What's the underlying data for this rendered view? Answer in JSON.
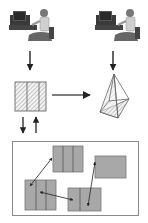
{
  "diagram": {
    "colors": {
      "background": "#ffffff",
      "stroke": "#555555",
      "arrow": "#222222",
      "block_fill": "#a8a8a8",
      "hatch": "#9a9a9a",
      "frame": "#8a8a8a"
    },
    "nodes": [
      {
        "id": "user-left",
        "type": "person-at-computer",
        "x": 10,
        "y": 5
      },
      {
        "id": "user-right",
        "type": "person-at-computer",
        "x": 96,
        "y": 5
      },
      {
        "id": "plan-view",
        "type": "hatched-rect-3-panels",
        "x": 15,
        "y": 82,
        "w": 31,
        "h": 29
      },
      {
        "id": "pyramid-model",
        "type": "hatched-pyramid",
        "x": 100,
        "y": 74
      },
      {
        "id": "block-frame",
        "type": "frame",
        "x": 12,
        "y": 141,
        "w": 127,
        "h": 75
      }
    ],
    "blocks": [
      {
        "id": "block-top",
        "x": 53,
        "y": 146,
        "w": 30,
        "h": 26,
        "panels": 3
      },
      {
        "id": "block-right",
        "x": 95,
        "y": 156,
        "w": 31,
        "h": 22,
        "panels": 1
      },
      {
        "id": "block-bottom-left",
        "x": 25,
        "y": 180,
        "w": 31,
        "h": 30,
        "panels": 3
      },
      {
        "id": "block-bottom-center",
        "x": 68,
        "y": 188,
        "w": 33,
        "h": 23,
        "panels": 2
      }
    ],
    "edges": [
      {
        "from": "user-left",
        "to": "plan-view",
        "style": "arrow-down"
      },
      {
        "from": "user-right",
        "to": "pyramid-model",
        "style": "arrow-down"
      },
      {
        "from": "plan-view",
        "to": "pyramid-model",
        "style": "arrow-right"
      },
      {
        "from": "plan-view",
        "to": "block-frame",
        "style": "arrow-down"
      },
      {
        "from": "block-frame",
        "to": "plan-view",
        "style": "arrow-up"
      },
      {
        "from": "block-bottom-left",
        "to": "block-top",
        "style": "double-arrow"
      },
      {
        "from": "block-bottom-left",
        "to": "block-bottom-center",
        "style": "double-arrow"
      },
      {
        "from": "block-right",
        "to": "block-bottom-center",
        "style": "double-arrow"
      }
    ]
  }
}
